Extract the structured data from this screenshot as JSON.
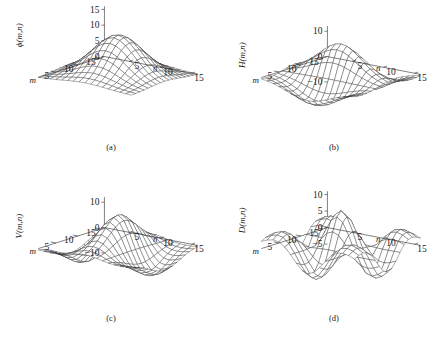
{
  "figure": {
    "type": "multi-panel-3d-surface-figure",
    "rows": 2,
    "cols": 2,
    "background": "#ffffff",
    "line_color": "#2b2b2b"
  },
  "panels": [
    {
      "id": "a",
      "caption": "(a)",
      "zlabel": "ϕ(m,n)",
      "zticks": [
        "15",
        "10",
        "5",
        "0"
      ],
      "ztick_values": [
        15,
        10,
        5,
        0
      ],
      "zlim": [
        -5,
        16
      ],
      "xlabel": "m",
      "ylabel": "n",
      "xticks": [
        "15",
        "10",
        "5"
      ],
      "yticks": [
        "5",
        "10",
        "15"
      ],
      "xtick_values": [
        15,
        10,
        5
      ],
      "ytick_values": [
        5,
        10,
        15
      ],
      "kind": "scaling"
    },
    {
      "id": "b",
      "caption": "(b)",
      "zlabel": "H(m,n)",
      "zticks": [
        "10",
        "0",
        "−10"
      ],
      "ztick_values": [
        10,
        0,
        -10
      ],
      "zlim": [
        -14,
        12
      ],
      "xlabel": "m",
      "ylabel": "n",
      "xticks": [
        "15",
        "10",
        "5"
      ],
      "yticks": [
        "5",
        "10",
        "15"
      ],
      "xtick_values": [
        15,
        10,
        5
      ],
      "ytick_values": [
        5,
        10,
        15
      ],
      "kind": "horizontal"
    },
    {
      "id": "c",
      "caption": "(c)",
      "zlabel": "V(m,n)",
      "zticks": [
        "10",
        "0",
        "−10"
      ],
      "ztick_values": [
        10,
        0,
        -10
      ],
      "zlim": [
        -14,
        12
      ],
      "xlabel": "m",
      "ylabel": "n",
      "xticks": [
        "15",
        "10",
        "5"
      ],
      "yticks": [
        "5",
        "10",
        "15"
      ],
      "xtick_values": [
        15,
        10,
        5
      ],
      "ytick_values": [
        5,
        10,
        15
      ],
      "kind": "vertical"
    },
    {
      "id": "d",
      "caption": "(d)",
      "zlabel": "D(m,n)",
      "zticks": [
        "10",
        "5",
        "0",
        "−5"
      ],
      "ztick_values": [
        10,
        5,
        0,
        -5
      ],
      "zlim": [
        -9,
        11
      ],
      "xlabel": "m",
      "ylabel": "n",
      "xticks": [
        "15",
        "10",
        "5"
      ],
      "yticks": [
        "5",
        "10",
        "15"
      ],
      "xtick_values": [
        15,
        10,
        5
      ],
      "ytick_values": [
        5,
        10,
        15
      ],
      "kind": "diagonal"
    }
  ],
  "chart_data": {
    "type": "surface",
    "title": "",
    "grid_n": 17,
    "domain": [
      1,
      16
    ],
    "panels": [
      {
        "name": "ϕ(m,n)",
        "peak": 13,
        "zlim": [
          -5,
          16
        ],
        "description": "2-D separable scaling function: single positive central peak"
      },
      {
        "name": "H(m,n)",
        "peak": 10,
        "trough": -13,
        "zlim": [
          -14,
          12
        ],
        "description": "horizontal wavelet: antisymmetric along n, positive ridge and negative trough"
      },
      {
        "name": "V(m,n)",
        "peak": 10,
        "trough": -13,
        "zlim": [
          -14,
          12
        ],
        "description": "vertical wavelet: antisymmetric along m"
      },
      {
        "name": "D(m,n)",
        "peak": 9,
        "trough": -8,
        "zlim": [
          -9,
          11
        ],
        "description": "diagonal wavelet: sharp central peak with four negative lobes"
      }
    ],
    "xlabel": "m",
    "ylabel": "n",
    "zlabel": "amplitude",
    "grid": true,
    "legend": "none"
  }
}
